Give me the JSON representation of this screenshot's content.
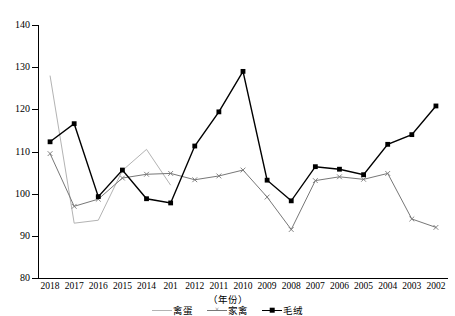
{
  "chart_data": {
    "type": "line",
    "title": "",
    "xlabel": "（年份）",
    "ylabel": "",
    "ylim": [
      80,
      140
    ],
    "ytick_step": 10,
    "yticks": [
      80,
      90,
      100,
      110,
      120,
      130,
      140
    ],
    "grid": false,
    "legend_position": "bottom",
    "categories": [
      "2018",
      "2017",
      "2016",
      "2015",
      "2014",
      "201",
      "2012",
      "2011",
      "2010",
      "2009",
      "2008",
      "2007",
      "2006",
      "2005",
      "2004",
      "2003",
      "2002"
    ],
    "series": [
      {
        "name": "禽蛋",
        "color": "#b3b3b3",
        "marker": "none",
        "values": [
          128.0,
          93.0,
          93.7,
          105.5,
          110.5,
          102.0,
          null,
          null,
          null,
          null,
          null,
          null,
          null,
          null,
          null,
          null,
          null
        ]
      },
      {
        "name": "家禽",
        "color": "#777777",
        "marker": "x",
        "values": [
          109.5,
          97.0,
          98.7,
          103.7,
          104.6,
          104.8,
          103.3,
          104.2,
          105.6,
          99.2,
          91.5,
          103.1,
          104.0,
          103.4,
          104.8,
          94.0,
          92.0
        ]
      },
      {
        "name": "毛绒",
        "color": "#000000",
        "marker": "square",
        "values": [
          112.3,
          116.6,
          99.3,
          105.6,
          98.8,
          97.8,
          111.3,
          119.4,
          129.0,
          103.2,
          98.3,
          106.4,
          105.8,
          104.5,
          111.7,
          114.0,
          120.8
        ]
      }
    ]
  }
}
